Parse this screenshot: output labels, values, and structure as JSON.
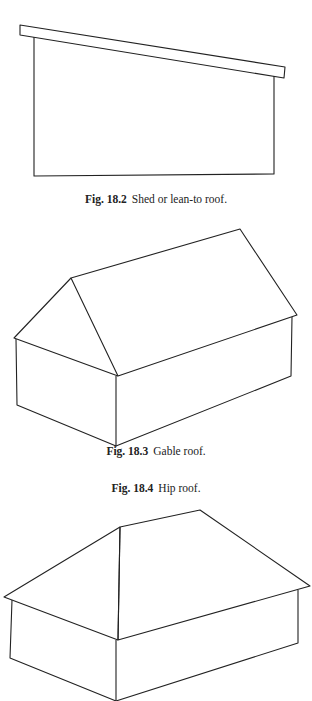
{
  "figures": [
    {
      "id": "fig-18-2",
      "number": "Fig. 18.2",
      "caption": "Shed or lean-to roof."
    },
    {
      "id": "fig-18-3",
      "number": "Fig. 18.3",
      "caption": "Gable roof."
    },
    {
      "id": "fig-18-4",
      "number": "Fig. 18.4",
      "caption": "Hip roof."
    }
  ]
}
